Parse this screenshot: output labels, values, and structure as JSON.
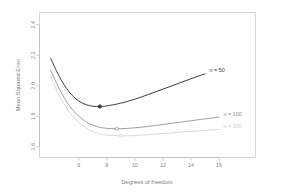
{
  "chart_data": {
    "type": "line",
    "title": "",
    "xlabel": "Degrees of freedom",
    "ylabel": "Mean Squared Error",
    "xlim": [
      3.2,
      18.6
    ],
    "ylim": [
      1.53,
      2.48
    ],
    "xticks": [
      6,
      8,
      10,
      12,
      14,
      16
    ],
    "xtick_labels": [
      "6",
      "8",
      "10",
      "12",
      "14",
      "16"
    ],
    "yticks": [
      1.6,
      1.8,
      2.0,
      2.2,
      2.4
    ],
    "ytick_labels": [
      "1.6",
      "1.8",
      "2.0",
      "2.2",
      "2.4"
    ],
    "grid": false,
    "legend_position": "right-inline",
    "series": [
      {
        "name": "n = 50",
        "label": "n = 50",
        "color": "#3d3d3d",
        "line_width": 1.0,
        "x": [
          4.0,
          4.5,
          5.0,
          5.5,
          6.0,
          6.5,
          7.0,
          7.5,
          8.0,
          9.0,
          10.0,
          11.0,
          12.0,
          13.0,
          14.0,
          15.0
        ],
        "y": [
          2.18,
          2.08,
          2.0,
          1.94,
          1.9,
          1.877,
          1.866,
          1.864,
          1.868,
          1.886,
          1.912,
          1.944,
          1.978,
          2.012,
          2.046,
          2.078
        ],
        "minimum": {
          "x": 7.5,
          "y": 1.864,
          "marker": "filled-circle"
        }
      },
      {
        "name": "n = 100",
        "label": "n = 100",
        "color": "#8c8c8c",
        "line_width": 0.85,
        "x": [
          4.0,
          4.5,
          5.0,
          5.5,
          6.0,
          6.5,
          7.0,
          7.5,
          8.0,
          8.7,
          9.5,
          10.5,
          11.5,
          12.5,
          13.5,
          14.5,
          16.0
        ],
        "y": [
          2.1,
          2.0,
          1.915,
          1.848,
          1.8,
          1.765,
          1.742,
          1.728,
          1.721,
          1.718,
          1.721,
          1.729,
          1.74,
          1.752,
          1.765,
          1.777,
          1.795
        ],
        "minimum": {
          "x": 8.7,
          "y": 1.718,
          "marker": "open-circle"
        }
      },
      {
        "name": "n = 200",
        "label": "n = 200",
        "color": "#d2d2d2",
        "line_width": 0.85,
        "x": [
          4.0,
          4.5,
          5.0,
          5.5,
          6.0,
          6.5,
          7.0,
          7.5,
          8.0,
          9.0,
          10.0,
          11.0,
          12.0,
          13.0,
          14.0,
          15.0,
          16.0
        ],
        "y": [
          2.06,
          1.955,
          1.872,
          1.808,
          1.76,
          1.724,
          1.7,
          1.685,
          1.677,
          1.672,
          1.674,
          1.68,
          1.687,
          1.694,
          1.701,
          1.708,
          1.714
        ],
        "minimum": {
          "x": 9.0,
          "y": 1.672,
          "marker": "open-circle"
        }
      }
    ]
  },
  "labels": {
    "xlabel_text": "Degrees of freedom",
    "ylabel_text": "Mean Squared Error"
  }
}
